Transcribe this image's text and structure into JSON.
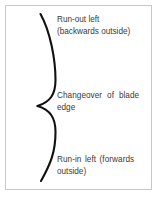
{
  "figure": {
    "frame_border_color": "#c8c8c8",
    "background_color": "#ffffff",
    "stroke_color": "#111111",
    "text_color": "#3a3a3a"
  },
  "brace": {
    "icon": "curly-brace-right-icon",
    "orientation": "points-left",
    "apex_label": "Changeover of blade edge"
  },
  "labels": {
    "runout": {
      "line1": "Run-out left",
      "line2": "(backwards outside)"
    },
    "changeover": {
      "line1": "Changeover of blade",
      "line2": "edge"
    },
    "runin": {
      "line1": "Run-in left (forwards",
      "line2": "outside)"
    }
  }
}
